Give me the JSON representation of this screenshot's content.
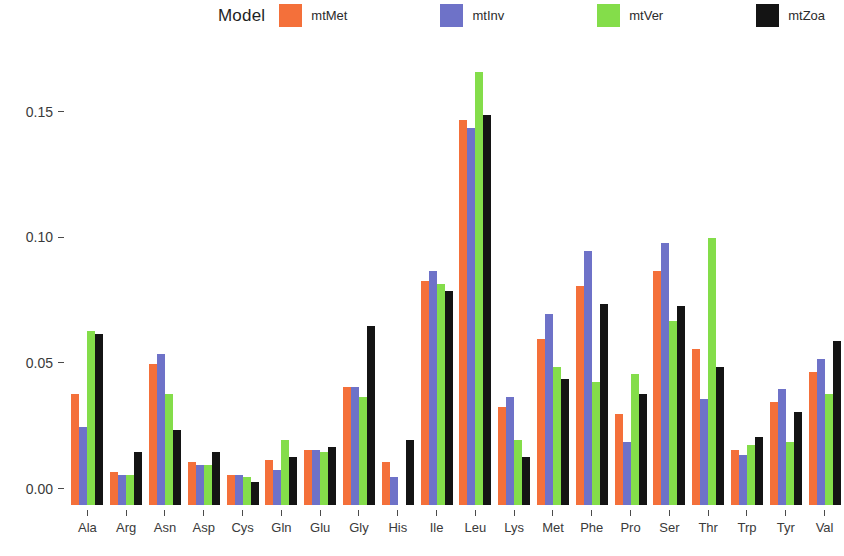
{
  "legend": {
    "title": "Model",
    "entries": [
      {
        "label": "mtMet",
        "color": "#f4703a"
      },
      {
        "label": "mtInv",
        "color": "#6e72c8"
      },
      {
        "label": "mtVer",
        "color": "#84dd4a"
      },
      {
        "label": "mtZoa",
        "color": "#141414"
      }
    ]
  },
  "axis": {
    "y_ticks": [
      "0.00",
      "0.05",
      "0.10",
      "0.15"
    ],
    "y_tick_values": [
      0.0,
      0.05,
      0.1,
      0.15
    ]
  },
  "chart_data": {
    "type": "bar",
    "title": "",
    "xlabel": "",
    "ylabel": "",
    "ylim": [
      0,
      0.18
    ],
    "grid": false,
    "legend_position": "top",
    "legend_title": "Model",
    "categories": [
      "Ala",
      "Arg",
      "Asn",
      "Asp",
      "Cys",
      "Gln",
      "Glu",
      "Gly",
      "His",
      "Ile",
      "Leu",
      "Lys",
      "Met",
      "Phe",
      "Pro",
      "Ser",
      "Thr",
      "Trp",
      "Tyr",
      "Val"
    ],
    "series": [
      {
        "name": "mtMet",
        "color": "#f4703a",
        "values": [
          0.044,
          0.013,
          0.056,
          0.017,
          0.012,
          0.018,
          0.022,
          0.047,
          0.017,
          0.089,
          0.153,
          0.039,
          0.066,
          0.087,
          0.036,
          0.093,
          0.062,
          0.022,
          0.041,
          0.053
        ]
      },
      {
        "name": "mtInv",
        "color": "#6e72c8",
        "values": [
          0.031,
          0.012,
          0.06,
          0.016,
          0.012,
          0.014,
          0.022,
          0.047,
          0.011,
          0.093,
          0.15,
          0.043,
          0.076,
          0.101,
          0.025,
          0.104,
          0.042,
          0.02,
          0.046,
          0.058
        ]
      },
      {
        "name": "mtVer",
        "color": "#84dd4a",
        "values": [
          0.069,
          0.012,
          0.044,
          0.016,
          0.011,
          0.026,
          0.021,
          0.043,
          0.0,
          0.088,
          0.172,
          0.026,
          0.055,
          0.049,
          0.052,
          0.073,
          0.106,
          0.024,
          0.025,
          0.044
        ]
      },
      {
        "name": "mtZoa",
        "color": "#141414",
        "values": [
          0.068,
          0.021,
          0.03,
          0.021,
          0.009,
          0.019,
          0.023,
          0.071,
          0.026,
          0.085,
          0.155,
          0.019,
          0.05,
          0.08,
          0.044,
          0.079,
          0.055,
          0.027,
          0.037,
          0.065
        ]
      }
    ]
  }
}
